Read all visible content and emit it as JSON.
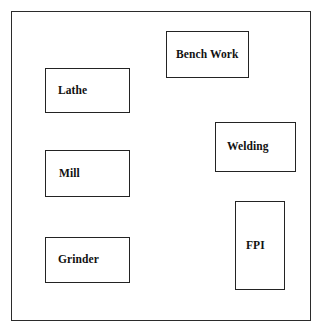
{
  "diagram": {
    "type": "facility-layout",
    "canvas": {
      "width": 328,
      "height": 335,
      "background_color": "#ffffff"
    },
    "frame": {
      "name": "facility-boundary",
      "border_color": "#2b2b2b",
      "fill_color": "#ffffff"
    },
    "stations": [
      {
        "id": "bench-work",
        "label": "Bench Work",
        "border_color": "#232323",
        "fill_color": "#ffffff"
      },
      {
        "id": "lathe",
        "label": "Lathe",
        "border_color": "#232323",
        "fill_color": "#ffffff"
      },
      {
        "id": "welding",
        "label": "Welding",
        "border_color": "#232323",
        "fill_color": "#ffffff"
      },
      {
        "id": "mill",
        "label": "Mill",
        "border_color": "#232323",
        "fill_color": "#ffffff"
      },
      {
        "id": "fpi",
        "label": "FPI",
        "border_color": "#232323",
        "fill_color": "#ffffff"
      },
      {
        "id": "grinder",
        "label": "Grinder",
        "border_color": "#232323",
        "fill_color": "#ffffff"
      }
    ]
  }
}
